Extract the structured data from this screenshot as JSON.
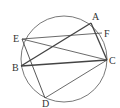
{
  "diagram": {
    "type": "circle-inscribed-geometry",
    "circle": {
      "cx": 64,
      "cy": 59,
      "r": 43,
      "stroke": "#555555"
    },
    "points": {
      "A": {
        "x": 91,
        "y": 23,
        "label": "A",
        "lx": 92,
        "ly": 20
      },
      "F": {
        "x": 102,
        "y": 33,
        "label": "F",
        "lx": 104,
        "ly": 37
      },
      "C": {
        "x": 107,
        "y": 60,
        "label": "C",
        "lx": 109,
        "ly": 64
      },
      "E": {
        "x": 22,
        "y": 39,
        "label": "E",
        "lx": 13,
        "ly": 42
      },
      "B": {
        "x": 21,
        "y": 66,
        "label": "B",
        "lx": 12,
        "ly": 71
      },
      "D": {
        "x": 45,
        "y": 98,
        "label": "D",
        "lx": 42,
        "ly": 107
      }
    },
    "segments": [
      {
        "from": "A",
        "to": "B",
        "weight": 1.4
      },
      {
        "from": "A",
        "to": "C",
        "weight": 1.3
      },
      {
        "from": "B",
        "to": "C",
        "weight": 1.4
      },
      {
        "from": "E",
        "to": "F",
        "weight": 0.8
      },
      {
        "from": "E",
        "to": "C",
        "weight": 0.8
      },
      {
        "from": "E",
        "to": "D",
        "weight": 0.9
      },
      {
        "from": "D",
        "to": "C",
        "weight": 0.8
      }
    ],
    "line_color": "#444444"
  }
}
